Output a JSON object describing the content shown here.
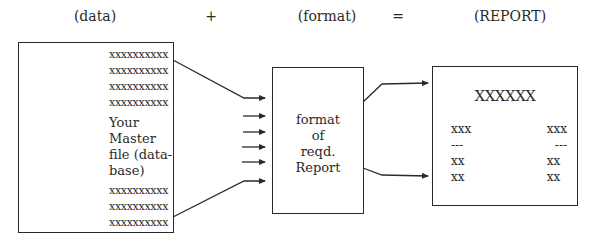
{
  "header": {
    "data_label": "(data)",
    "plus": "+",
    "format_label": "(format)",
    "equals": "=",
    "report_label": "(REPORT)"
  },
  "master_file": {
    "top_rows": [
      "xxxxxxxxxx",
      "xxxxxxxxxx",
      "xxxxxxxxxx",
      "xxxxxxxxxx"
    ],
    "label_lines": [
      "Your Master",
      "file (data-",
      "base)"
    ],
    "bottom_rows": [
      "xxxxxxxxxx",
      "xxxxxxxxxx",
      "xxxxxxxxxx"
    ]
  },
  "format_box": {
    "label_lines": [
      "format",
      "of",
      "reqd.",
      "Report"
    ]
  },
  "report_box": {
    "title": "XXXXXX",
    "left_column": [
      "xxx",
      "---",
      "xx",
      "xx"
    ],
    "right_column": [
      "xxx",
      "---",
      "xx",
      "xx"
    ]
  },
  "connectors": {
    "input_arrow_count": 6,
    "output_arrow_count": 2,
    "line_color": "#2a2a2a"
  }
}
